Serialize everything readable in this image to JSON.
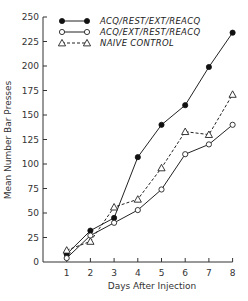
{
  "chart_data": {
    "type": "line",
    "title": "",
    "xlabel": "Days After Injection",
    "ylabel": "Mean Number Bar Presses",
    "x": [
      1,
      2,
      3,
      4,
      5,
      6,
      7,
      8
    ],
    "xlim": [
      0,
      8
    ],
    "ylim": [
      0,
      250
    ],
    "yticks": [
      0,
      25,
      50,
      75,
      100,
      125,
      150,
      175,
      200,
      225,
      250
    ],
    "xticks": [
      1,
      2,
      3,
      4,
      5,
      6,
      7,
      8
    ],
    "grid": false,
    "legend_position": "upper left",
    "series": [
      {
        "name": "ACQ/REST/EXT/REACQ",
        "marker": "filled-circle",
        "line": "solid",
        "values": [
          8,
          32,
          45,
          107,
          140,
          160,
          199,
          234
        ]
      },
      {
        "name": "ACQ/EXT/REST/REACQ",
        "marker": "open-circle",
        "line": "solid",
        "values": [
          4,
          27,
          40,
          53,
          74,
          110,
          120,
          140
        ]
      },
      {
        "name": "NAIVE CONTROL",
        "marker": "open-triangle",
        "line": "dashed",
        "values": [
          12,
          21,
          56,
          64,
          96,
          133,
          130,
          171
        ]
      }
    ]
  },
  "labels": {
    "xlabel": "Days After Injection",
    "ylabel": "Mean Number Bar Presses",
    "legend": [
      "ACQ/REST/EXT/REACQ",
      "ACQ/EXT/REST/REACQ",
      "NAIVE CONTROL"
    ]
  }
}
